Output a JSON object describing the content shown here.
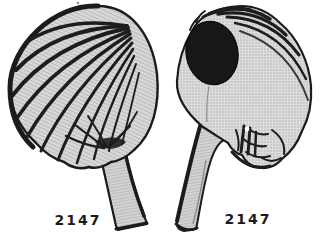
{
  "colors": {
    "paper": "#ffffff",
    "ink": "#1b1b1b",
    "halftone_light": "#d7d7d7",
    "halftone_mid": "#a8a8a8",
    "dark_patch": "#171717"
  },
  "figures": [
    {
      "caption": "2147"
    },
    {
      "caption": "2147"
    }
  ]
}
